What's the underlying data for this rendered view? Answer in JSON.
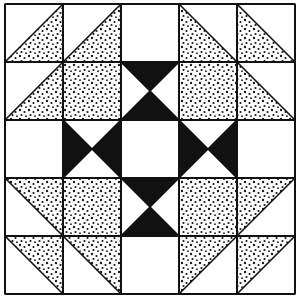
{
  "colors": {
    "background": "#ffffff",
    "line": "#111111",
    "solid": "#111111",
    "dot": "#1a1a1a"
  },
  "grid": {
    "x0": 5,
    "y0": 4,
    "cell": 58,
    "rows": 5,
    "cols": 5
  },
  "legend": {
    "hst-br": "white upper-left, dotted lower-right (diagonal /)",
    "hst-bl": "white upper-right, dotted lower-left (diagonal \\)",
    "hst-tr": "dotted upper-right, white lower-left (diagonal \\ ... mirror)",
    "hst-tl": "dotted upper-left, white lower-right",
    "dot": "fully dotted square",
    "white": "plain white square",
    "hg-ns": "hourglass, black triangles top and bottom",
    "hg-we": "hourglass, black triangles left and right"
  },
  "cells": [
    [
      "hst-br",
      "hst-br",
      "white",
      "hst-bl",
      "hst-bl"
    ],
    [
      "hst-br",
      "dot",
      "hg-ns",
      "dot",
      "hst-bl"
    ],
    [
      "white",
      "hg-we",
      "white",
      "hg-we",
      "white"
    ],
    [
      "hst-tr",
      "dot",
      "hg-ns",
      "dot",
      "hst-tl"
    ],
    [
      "hst-tr",
      "hst-tr",
      "white",
      "hst-tl",
      "hst-tl"
    ]
  ]
}
